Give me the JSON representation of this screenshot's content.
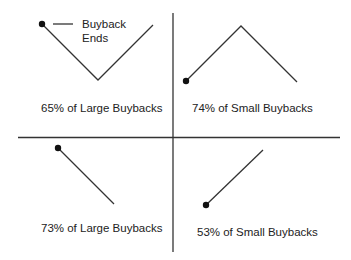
{
  "diagram": {
    "legend": {
      "line1": "Buyback",
      "line2": "Ends"
    },
    "quadrants": [
      {
        "id": "top-left",
        "label": "65% of Large Buybacks",
        "shape": "V (falls then rises), buyback ends at start"
      },
      {
        "id": "top-right",
        "label": "74% of Small Buybacks",
        "shape": "inverted V (rises then falls), buyback ends at start"
      },
      {
        "id": "bottom-left",
        "label": "73% of Large Buybacks",
        "shape": "declining line, buyback ends at start"
      },
      {
        "id": "bottom-right",
        "label": "53% of Small Buybacks",
        "shape": "rising line, buyback ends at start"
      }
    ],
    "colors": {
      "line": "#333333",
      "axis": "#333333",
      "text": "#222222"
    }
  }
}
